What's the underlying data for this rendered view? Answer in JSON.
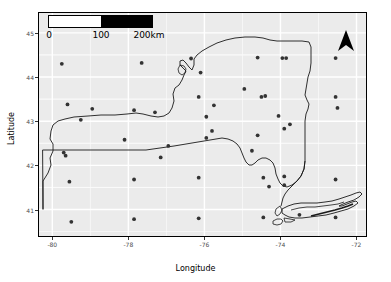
{
  "chart_data": {
    "type": "scatter",
    "title": "",
    "xlabel": "Longitude",
    "ylabel": "Latitude",
    "xlim": [
      -80.35,
      -71.75
    ],
    "ylim": [
      40.4,
      45.45
    ],
    "xticks": [
      -80,
      -78,
      -76,
      -74,
      -72
    ],
    "xticklabels": [
      "-80",
      "-78",
      "-76",
      "-74",
      "-72"
    ],
    "yticks": [
      41,
      42,
      43,
      44,
      45
    ],
    "yticklabels": [
      "41",
      "42",
      "43",
      "44",
      "45"
    ],
    "grid": true,
    "grid_color": "#ffffff",
    "panel_background": "#ebebeb",
    "point_color": "#333333",
    "legend": "none",
    "region": "New York State",
    "points": [
      [
        -79.75,
        44.3
      ],
      [
        -77.65,
        44.32
      ],
      [
        -76.35,
        44.42
      ],
      [
        -74.6,
        44.44
      ],
      [
        -73.95,
        44.43
      ],
      [
        -73.85,
        44.43
      ],
      [
        -72.55,
        44.43
      ],
      [
        -76.1,
        44.1
      ],
      [
        -79.6,
        43.38
      ],
      [
        -78.95,
        43.28
      ],
      [
        -76.15,
        43.55
      ],
      [
        -74.95,
        43.73
      ],
      [
        -74.5,
        43.55
      ],
      [
        -74.4,
        43.57
      ],
      [
        -75.75,
        43.36
      ],
      [
        -72.55,
        43.55
      ],
      [
        -79.25,
        43.03
      ],
      [
        -77.85,
        43.25
      ],
      [
        -77.3,
        43.2
      ],
      [
        -75.95,
        43.1
      ],
      [
        -74.05,
        43.12
      ],
      [
        -73.75,
        42.93
      ],
      [
        -72.5,
        43.3
      ],
      [
        -75.8,
        42.78
      ],
      [
        -73.9,
        42.83
      ],
      [
        -74.6,
        42.68
      ],
      [
        -75.95,
        42.62
      ],
      [
        -78.1,
        42.58
      ],
      [
        -76.95,
        42.44
      ],
      [
        -74.75,
        42.33
      ],
      [
        -79.7,
        42.29
      ],
      [
        -79.65,
        42.22
      ],
      [
        -77.15,
        42.18
      ],
      [
        -79.55,
        41.63
      ],
      [
        -77.85,
        41.68
      ],
      [
        -76.15,
        41.72
      ],
      [
        -74.45,
        41.72
      ],
      [
        -73.9,
        41.75
      ],
      [
        -73.9,
        41.55
      ],
      [
        -74.3,
        41.52
      ],
      [
        -72.55,
        41.68
      ],
      [
        -79.5,
        40.72
      ],
      [
        -77.85,
        40.78
      ],
      [
        -76.15,
        40.8
      ],
      [
        -74.45,
        40.82
      ],
      [
        -73.5,
        40.88
      ],
      [
        -72.55,
        40.82
      ]
    ],
    "annotations": {
      "north_arrow": "north-arrow",
      "scale_bar": "0 to 200 km"
    }
  },
  "scalebar": {
    "label_0": "0",
    "label_100": "100",
    "label_200": "200km",
    "white_fill": "#ffffff",
    "black_fill": "#000000"
  },
  "axes": {
    "xlabel": "Longitude",
    "ylabel": "Latitude",
    "xticklabels": [
      "-80",
      "-78",
      "-76",
      "-74",
      "-72"
    ],
    "yticklabels": [
      "41",
      "42",
      "43",
      "44",
      "45"
    ]
  }
}
